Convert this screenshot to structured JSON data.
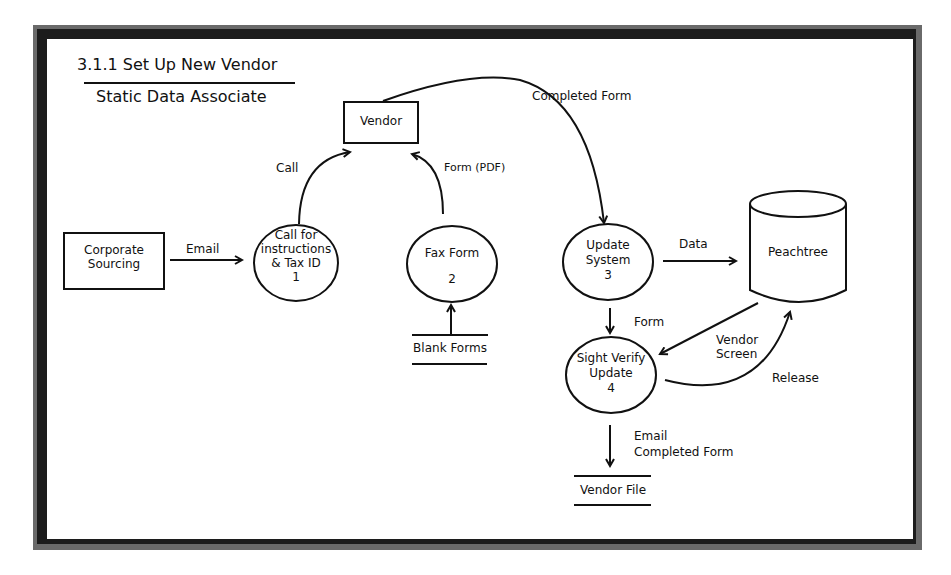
{
  "diagram": {
    "title": "3.1.1 Set Up New Vendor",
    "subtitle": "Static Data Associate",
    "external_entities": [
      {
        "id": "corporate-sourcing",
        "label": "Corporate\nSourcing",
        "line1": "Corporate",
        "line2": "Sourcing"
      },
      {
        "id": "vendor",
        "label": "Vendor"
      }
    ],
    "processes": [
      {
        "id": "1",
        "line1": "Call for",
        "line2": "instructions",
        "line3": "& Tax ID",
        "number": "1"
      },
      {
        "id": "2",
        "line1": "Fax Form",
        "number": "2"
      },
      {
        "id": "3",
        "line1": "Update",
        "line2": "System",
        "number": "3"
      },
      {
        "id": "4",
        "line1": "Sight Verify",
        "line2": "Update",
        "number": "4"
      }
    ],
    "data_stores": [
      {
        "id": "blank-forms",
        "label": "Blank Forms"
      },
      {
        "id": "vendor-file",
        "label": "Vendor File"
      },
      {
        "id": "peachtree",
        "label": "Peachtree"
      }
    ],
    "flows": {
      "email": "Email",
      "call": "Call",
      "form_pdf": "Form (PDF)",
      "completed_form": "Completed Form",
      "data": "Data",
      "form": "Form",
      "vendor_screen_1": "Vendor",
      "vendor_screen_2": "Screen",
      "release": "Release",
      "email_completed_1": "Email",
      "email_completed_2": "Completed Form"
    },
    "colors": {
      "stroke": "#111111",
      "frame_dark": "#1c1c1c",
      "frame_shadow": "#6a6a6a",
      "background": "#ffffff"
    }
  }
}
